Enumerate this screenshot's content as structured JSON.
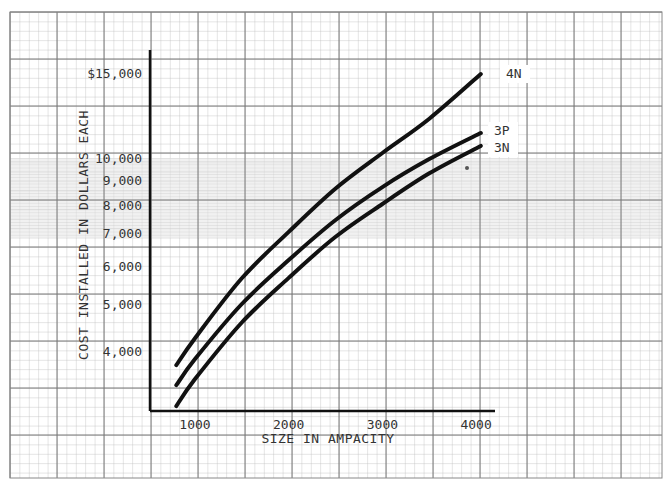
{
  "chart_data": {
    "type": "line",
    "title": "",
    "xlabel": "SIZE IN AMPACITY",
    "ylabel": "COST INSTALLED IN DOLLARS EACH",
    "xscale": "linear",
    "yscale": "log",
    "xlim": [
      500,
      4300
    ],
    "ylim": [
      3000,
      17000
    ],
    "grid": true,
    "legend_position": "inline-right-end",
    "x_ticks": [
      1000,
      2000,
      3000,
      4000
    ],
    "x_tick_labels": [
      "1000",
      "2000",
      "3000",
      "4000"
    ],
    "y_ticks": [
      4000,
      5000,
      6000,
      7000,
      8000,
      9000,
      10000,
      15000
    ],
    "y_tick_labels": [
      "4,000",
      "5,000",
      "6,000",
      "7,000",
      "8,000",
      "9,000",
      "10,000",
      "$15,000"
    ],
    "x": [
      800,
      1000,
      1500,
      2000,
      2500,
      3000,
      3500,
      4050
    ],
    "series": [
      {
        "name": "4N",
        "values": [
          3740,
          4250,
          5650,
          7040,
          8650,
          10240,
          12050,
          14900
        ]
      },
      {
        "name": "3P",
        "values": [
          3400,
          3850,
          5000,
          6160,
          7450,
          8710,
          9950,
          11260
        ]
      },
      {
        "name": "3N",
        "values": [
          3080,
          3500,
          4580,
          5660,
          6880,
          8040,
          9300,
          10590
        ]
      }
    ],
    "annotations": [
      "4N",
      "3P",
      "3N"
    ]
  },
  "labels": {
    "x_axis_title": "SIZE IN AMPACITY",
    "y_axis_title": "COST INSTALLED IN DOLLARS EACH"
  },
  "colors": {
    "curve": "#111111",
    "grid_minor": "#b8b8b8",
    "grid_major": "#6a6a6a",
    "shaded_band": "#e6e6e6",
    "text": "#333333"
  }
}
